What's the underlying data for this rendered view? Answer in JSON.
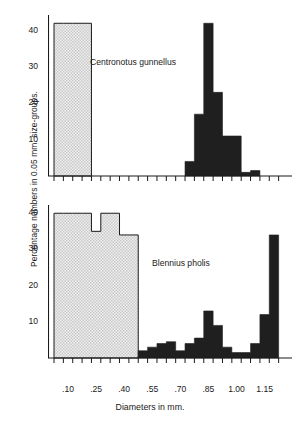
{
  "figure": {
    "y_axis_label": "Percentage numbers in 0.05 mm. size-groups.",
    "x_axis_label": "Diameters in mm."
  },
  "panels": [
    {
      "name": "top",
      "species": "Centronotus gunnellus",
      "y_ticks": [
        "40",
        "30",
        "20",
        "10"
      ]
    },
    {
      "name": "bottom",
      "species": "Blennius pholis",
      "y_ticks": [
        "40",
        "30",
        "20",
        "10"
      ]
    }
  ],
  "x_ticks": [
    ".10",
    ".25",
    ".40",
    ".55",
    ".70",
    ".85",
    "1.00",
    "1.15"
  ],
  "chart_data": [
    {
      "type": "bar",
      "title": "Centronotus gunnellus",
      "xlabel": "Diameters in mm.",
      "ylabel": "Percentage numbers in 0.05 mm. size-groups.",
      "xlim": [
        0.05,
        1.3
      ],
      "ylim": [
        0,
        44
      ],
      "bin_width": 0.05,
      "grid": false,
      "legend": "none",
      "series": [
        {
          "name": "unfertilised (stippled block)",
          "fill": "#e0e0e0",
          "bins": [
            0.05,
            0.1,
            0.15,
            0.2
          ],
          "values": [
            42,
            42,
            42,
            42
          ]
        },
        {
          "name": "ripe eggs (solid black)",
          "fill": "#1a1a1a",
          "bins": [
            0.75,
            0.8,
            0.85,
            0.9,
            0.95,
            1.0,
            1.05,
            1.1
          ],
          "values": [
            4,
            17,
            42,
            23,
            11,
            11,
            1,
            1.5
          ]
        }
      ]
    },
    {
      "type": "bar",
      "title": "Blennius pholis",
      "xlabel": "Diameters in mm.",
      "ylabel": "Percentage numbers in 0.05 mm. size-groups.",
      "xlim": [
        0.05,
        1.3
      ],
      "ylim": [
        0,
        42
      ],
      "bin_width": 0.05,
      "grid": false,
      "legend": "none",
      "series": [
        {
          "name": "unfertilised (stippled block)",
          "fill": "#e8e8e8",
          "bins": [
            0.05,
            0.1,
            0.15,
            0.2,
            0.25,
            0.3,
            0.35,
            0.4,
            0.45
          ],
          "values": [
            40,
            40,
            40,
            40,
            35,
            40,
            40,
            34,
            34
          ]
        },
        {
          "name": "ripe eggs (solid black)",
          "fill": "#1a1a1a",
          "bins": [
            0.5,
            0.55,
            0.6,
            0.65,
            0.7,
            0.75,
            0.8,
            0.85,
            0.9,
            0.95,
            1.0,
            1.05,
            1.1,
            1.15,
            1.2
          ],
          "values": [
            2,
            3,
            4,
            4.5,
            2,
            4,
            5.5,
            13,
            9,
            3,
            1.5,
            1.5,
            4,
            12,
            34
          ]
        }
      ]
    }
  ],
  "colors": {
    "ink": "#1a1a1a",
    "stipple_fill": "#e4e4e4",
    "solid_fill": "#1f1f1f",
    "background": "#ffffff"
  }
}
